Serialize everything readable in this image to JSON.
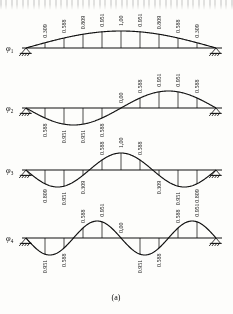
{
  "figure": {
    "caption": "(a)",
    "title_text": "",
    "line_color": "#18181a",
    "background_color": "#fdfdfb"
  },
  "chart_data": {
    "type": "line",
    "title": "(a)",
    "xlabel": "",
    "ylabel": "",
    "grid": false,
    "legend": "none",
    "x": [
      0,
      0.1,
      0.2,
      0.3,
      0.4,
      0.5,
      0.6,
      0.7,
      0.8,
      0.9,
      1.0
    ],
    "ylim": [
      -1.0,
      1.0
    ],
    "series": [
      {
        "name": "φ₁",
        "label_sub": "1",
        "values": [
          0,
          0.309,
          0.588,
          0.809,
          0.951,
          1.0,
          0.951,
          0.809,
          0.588,
          0.309,
          0
        ],
        "labels": [
          "0.309",
          "0.588",
          "0.809",
          "0.951",
          "1,00",
          "0.951",
          "0.809",
          "0.588",
          "0.309"
        ]
      },
      {
        "name": "φ₂",
        "label_sub": "2",
        "values": [
          0,
          -0.588,
          -0.951,
          -0.951,
          -0.588,
          0.0,
          0.588,
          0.951,
          0.951,
          0.588,
          0
        ],
        "labels": [
          "0.588",
          "0.951",
          "0.951",
          "0.588",
          "0,00",
          "0.588",
          "0.951",
          "0.951",
          "0.588"
        ]
      },
      {
        "name": "φ₃",
        "label_sub": "3",
        "values": [
          0,
          -0.809,
          -0.951,
          -0.309,
          0.588,
          1.0,
          0.588,
          -0.309,
          -0.951,
          -0.809,
          0
        ],
        "labels": [
          "0.809",
          "0.951",
          "0.309",
          "0.588",
          "1,00",
          "0.588",
          "0.309",
          "0.951",
          "0.809"
        ]
      },
      {
        "name": "φ₄",
        "label_sub": "4",
        "values": [
          0,
          -0.951,
          -0.588,
          0.588,
          0.951,
          0.0,
          -0.951,
          -0.588,
          0.588,
          0.951,
          0
        ],
        "labels": [
          "0.951",
          "0.588",
          "0.588",
          "0.951",
          "0,00",
          "0.951",
          "0.588",
          "0.588",
          "0.951"
        ]
      }
    ]
  },
  "panels": [
    {
      "id": "mode-1",
      "phi": "φ",
      "sub": "1"
    },
    {
      "id": "mode-2",
      "phi": "φ",
      "sub": "2"
    },
    {
      "id": "mode-3",
      "phi": "φ",
      "sub": "3"
    },
    {
      "id": "mode-4",
      "phi": "φ",
      "sub": "4"
    }
  ]
}
